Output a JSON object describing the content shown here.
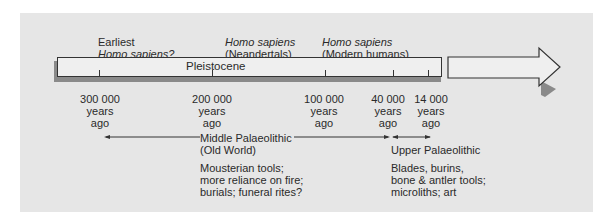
{
  "diagram": {
    "period_label": "Pleistocene",
    "species_labels": [
      {
        "line1": "Earliest",
        "line2": "Homo sapiens?",
        "line1_italic": false,
        "line2_italic": true
      },
      {
        "line1": "Homo sapiens",
        "line2": "(Neandertals)",
        "line1_italic": true,
        "line2_italic": false
      },
      {
        "line1": "Homo sapiens",
        "line2": "(Modern humans)",
        "line1_italic": true,
        "line2_italic": false
      }
    ],
    "time_markers": [
      {
        "value": "300 000",
        "unit": "years",
        "suffix": "ago"
      },
      {
        "value": "200 000",
        "unit": "years",
        "suffix": "ago"
      },
      {
        "value": "100 000",
        "unit": "years",
        "suffix": "ago"
      },
      {
        "value": "40 000",
        "unit": "years",
        "suffix": "ago"
      },
      {
        "value": "14 000",
        "unit": "years",
        "suffix": "ago"
      }
    ],
    "eras": [
      {
        "name": "Middle Palaeolithic",
        "subtitle": "(Old World)",
        "notes": [
          "Mousterian tools;",
          "more reliance on fire;",
          "burials; funeral rites?"
        ]
      },
      {
        "name": "Upper Palaeolithic",
        "subtitle": "",
        "notes": [
          "Blades, burins,",
          "bone & antler tools;",
          "microliths; art"
        ]
      }
    ],
    "colors": {
      "background": "#e6e6e6",
      "bar_fill": "#efefef",
      "stroke": "#333333",
      "shadow": "#8a8a8a"
    }
  }
}
